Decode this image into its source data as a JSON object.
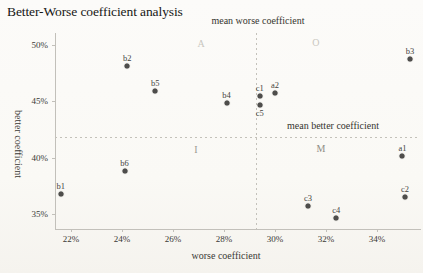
{
  "chart_data": {
    "type": "scatter",
    "title": "Better-Worse coefficient analysis",
    "xlabel": "worse coefficient",
    "ylabel": "better coefficient",
    "xlim": [
      21.37,
      35.69
    ],
    "ylim": [
      33.69,
      51.06
    ],
    "grid": false,
    "x_ticks": [
      {
        "value": 22,
        "label": "22%"
      },
      {
        "value": 24,
        "label": "24%"
      },
      {
        "value": 26,
        "label": "26%"
      },
      {
        "value": 28,
        "label": "28%"
      },
      {
        "value": 30,
        "label": "30%"
      },
      {
        "value": 32,
        "label": "32%"
      },
      {
        "value": 34,
        "label": "34%"
      }
    ],
    "y_ticks": [
      {
        "value": 35,
        "label": "35%"
      },
      {
        "value": 40,
        "label": "40%"
      },
      {
        "value": 45,
        "label": "45%"
      },
      {
        "value": 50,
        "label": "50%"
      }
    ],
    "mean_worse": 29.25,
    "mean_better": 41.8,
    "mean_worse_label": "mean worse coefficient",
    "mean_better_label": "mean better coefficient",
    "marker_color": "#4e4d4b",
    "quadrant_labels": [
      {
        "text": "A",
        "x": 27.1,
        "y": 50.2,
        "color": "#c9c7c0"
      },
      {
        "text": "O",
        "x": 31.6,
        "y": 50.3,
        "color": "#c9c7c0"
      },
      {
        "text": "I",
        "x": 26.9,
        "y": 40.8,
        "color": "#9b9990"
      },
      {
        "text": "M",
        "x": 31.8,
        "y": 40.9,
        "color": "#8f8d85"
      }
    ],
    "points": [
      {
        "label": "b1",
        "x": 21.6,
        "y": 36.8,
        "label_pos": "above"
      },
      {
        "label": "b2",
        "x": 24.2,
        "y": 48.1,
        "label_pos": "above"
      },
      {
        "label": "b3",
        "x": 35.3,
        "y": 48.8,
        "label_pos": "above"
      },
      {
        "label": "b4",
        "x": 28.1,
        "y": 44.9,
        "label_pos": "above"
      },
      {
        "label": "b5",
        "x": 25.3,
        "y": 45.9,
        "label_pos": "above"
      },
      {
        "label": "b6",
        "x": 24.1,
        "y": 38.8,
        "label_pos": "above"
      },
      {
        "label": "a1",
        "x": 35.0,
        "y": 40.2,
        "label_pos": "above"
      },
      {
        "label": "a2",
        "x": 30.0,
        "y": 45.7,
        "label_pos": "above"
      },
      {
        "label": "c1",
        "x": 29.4,
        "y": 45.5,
        "label_pos": "above"
      },
      {
        "label": "c2",
        "x": 35.1,
        "y": 36.5,
        "label_pos": "above"
      },
      {
        "label": "c3",
        "x": 31.3,
        "y": 35.7,
        "label_pos": "above"
      },
      {
        "label": "c4",
        "x": 32.4,
        "y": 34.7,
        "label_pos": "above"
      },
      {
        "label": "c5",
        "x": 29.4,
        "y": 44.7,
        "label_pos": "below"
      }
    ]
  }
}
